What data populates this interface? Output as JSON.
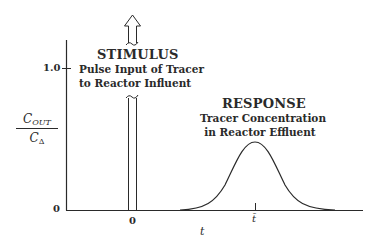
{
  "diagram": {
    "stimulus": {
      "title": "STIMULUS",
      "line1": "Pulse Input of Tracer",
      "line2": "to Reactor Influent"
    },
    "response": {
      "title": "RESPONSE",
      "line1": "Tracer Concentration",
      "line2": "in Reactor Effluent"
    },
    "y_axis": {
      "label_numerator": "C",
      "label_numerator_sub": "OUT",
      "label_denominator": "C",
      "label_denominator_sub": "Δ",
      "ticks": [
        "1.0",
        "0"
      ]
    },
    "x_axis": {
      "label": "t",
      "ticks": [
        "0",
        "t̄"
      ]
    },
    "colors": {
      "line": "#2a2a2a",
      "background": "#ffffff"
    }
  }
}
